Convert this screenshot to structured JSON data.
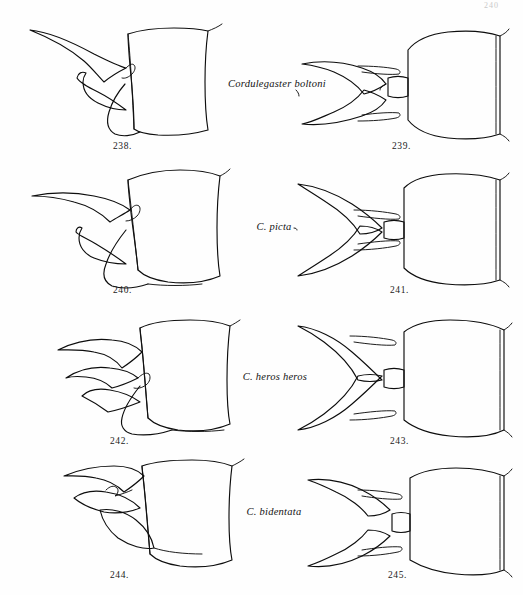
{
  "plate": {
    "page_mark": "240",
    "background_color": "#fefefe",
    "ink_color": "#0d0d0d",
    "width": 523,
    "height": 595
  },
  "species_labels": [
    {
      "name": "Cordulegaster boltoni"
    },
    {
      "name": "C. picta"
    },
    {
      "name": "C. heros heros"
    },
    {
      "name": "C. bidentata"
    }
  ],
  "figures": [
    {
      "number": "238.",
      "view": "lateral",
      "species": "Cordulegaster boltoni"
    },
    {
      "number": "239.",
      "view": "dorsal",
      "species": "Cordulegaster boltoni"
    },
    {
      "number": "240.",
      "view": "lateral",
      "species": "C. picta"
    },
    {
      "number": "241.",
      "view": "dorsal",
      "species": "C. picta"
    },
    {
      "number": "242.",
      "view": "lateral",
      "species": "C. heros heros"
    },
    {
      "number": "243.",
      "view": "dorsal",
      "species": "C. heros heros"
    },
    {
      "number": "244.",
      "view": "lateral",
      "species": "C. bidentata"
    },
    {
      "number": "245.",
      "view": "dorsal",
      "species": "C. bidentata"
    }
  ]
}
